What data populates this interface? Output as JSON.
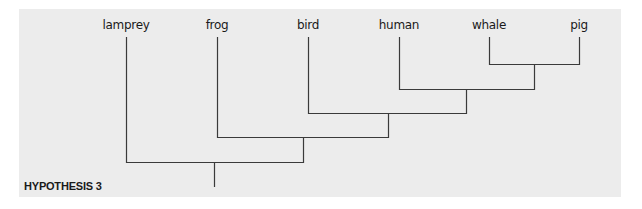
{
  "figure": {
    "caption": "HYPOTHESIS 3",
    "background_color": "#ececec",
    "line_color": "#3a3a3a"
  },
  "taxa": [
    {
      "label": "lamprey",
      "x": 126
    },
    {
      "label": "frog",
      "x": 217
    },
    {
      "label": "bird",
      "x": 308
    },
    {
      "label": "human",
      "x": 399
    },
    {
      "label": "whale",
      "x": 489
    },
    {
      "label": "pig",
      "x": 579
    }
  ],
  "tree": {
    "newick": "(lamprey,(frog,(bird,(human,(whale,pig)))));",
    "root_x": 214
  }
}
